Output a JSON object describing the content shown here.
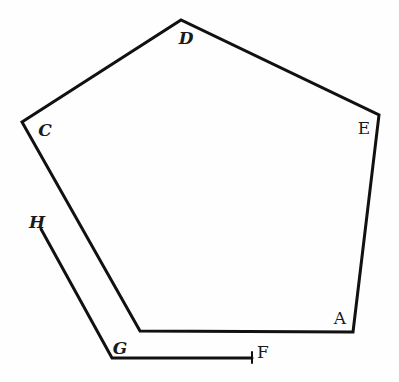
{
  "diagram": {
    "type": "geometric-figure",
    "colors": {
      "ink": "#111111",
      "background": "#fefefe"
    },
    "pentagon": {
      "vertices": [
        {
          "name": "A",
          "x": 353,
          "y": 332
        },
        {
          "name": "E",
          "x": 379,
          "y": 115
        },
        {
          "name": "D",
          "x": 181,
          "y": 20
        },
        {
          "name": "C",
          "x": 22,
          "y": 122
        },
        {
          "name": "B_corner",
          "x": 140,
          "y": 331
        }
      ]
    },
    "offset_path": {
      "points": [
        {
          "name": "H",
          "x": 41,
          "y": 229
        },
        {
          "name": "G",
          "x": 112,
          "y": 358
        },
        {
          "name": "F",
          "x": 252,
          "y": 358
        }
      ]
    },
    "labels": [
      {
        "id": "A",
        "text": "A",
        "x": 340,
        "y": 318
      },
      {
        "id": "C",
        "text": "C",
        "x": 45,
        "y": 130
      },
      {
        "id": "D",
        "text": "D",
        "x": 186,
        "y": 38
      },
      {
        "id": "E",
        "text": "E",
        "x": 364,
        "y": 128
      },
      {
        "id": "F",
        "text": "F",
        "x": 263,
        "y": 352
      },
      {
        "id": "G",
        "text": "G",
        "x": 120,
        "y": 348
      },
      {
        "id": "H",
        "text": "H",
        "x": 37,
        "y": 222
      }
    ]
  }
}
